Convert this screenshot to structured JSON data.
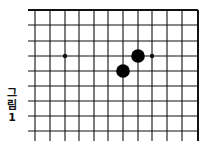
{
  "caption": {
    "chars": [
      "그",
      "림",
      "1"
    ],
    "full": "그림 1"
  },
  "board": {
    "line_color": "#111111",
    "stone_color": "#000000",
    "background": "#ffffff",
    "x_lines": [
      35,
      50,
      65,
      79,
      94,
      108,
      123,
      138,
      152,
      167,
      182,
      198
    ],
    "y_lines": [
      10,
      25,
      41,
      56,
      71,
      86,
      101,
      116,
      131
    ],
    "x_start": 28,
    "y_end": 141,
    "top_edge": true,
    "right_edge": true,
    "star_points": [
      {
        "x": 65,
        "y": 56
      },
      {
        "x": 152,
        "y": 56
      }
    ],
    "stones": [
      {
        "color": "black",
        "x": 138,
        "y": 56
      },
      {
        "color": "black",
        "x": 123,
        "y": 71
      }
    ]
  }
}
